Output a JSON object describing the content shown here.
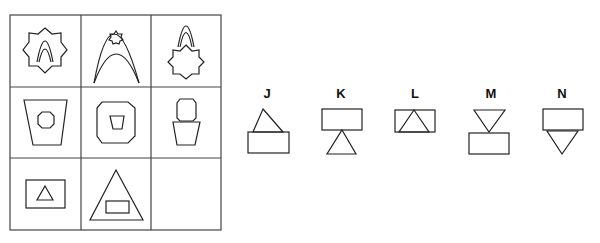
{
  "puzzle": {
    "type": "3x3 matrix, missing bottom-right cell",
    "grid": [
      [
        "star-with-arch-inside",
        "arch-with-small-star-inside",
        "arch-on-top-of-star"
      ],
      [
        "trapezoid-with-octagon-inside",
        "octagon-with-trapezoid-inside",
        "octagon-on-top-of-trapezoid"
      ],
      [
        "rectangle-with-triangle-inside",
        "triangle-with-rectangle-inside",
        "missing"
      ]
    ],
    "options": [
      {
        "label": "J",
        "desc": "triangle on top of rectangle"
      },
      {
        "label": "K",
        "desc": "rectangle on top of triangle"
      },
      {
        "label": "L",
        "desc": "triangle inside rectangle"
      },
      {
        "label": "M",
        "desc": "inverted triangle on top of rectangle"
      },
      {
        "label": "N",
        "desc": "rectangle on top of inverted triangle"
      }
    ]
  }
}
